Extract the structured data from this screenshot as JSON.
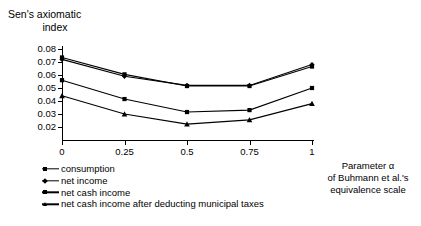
{
  "title": {
    "line1": "Sen's axiomatic",
    "line2": "index"
  },
  "axis": {
    "y_ticks": [
      "0.08",
      "0.07",
      "0.06",
      "0.05",
      "0.04",
      "0.03",
      "0.02"
    ],
    "x_ticks": [
      "0",
      "0.25",
      "0.5",
      "0.75",
      "1"
    ],
    "x_caption_line1": "Parameter α",
    "x_caption_line2": "of Buhmann et al.'s",
    "x_caption_line3": "equivalence scale"
  },
  "legend": {
    "items": [
      {
        "label": "consumption",
        "marker": "square"
      },
      {
        "label": "net income",
        "marker": "diamond"
      },
      {
        "label": "net cash income",
        "marker": "square"
      },
      {
        "label": "net cash income after deducting municipal taxes",
        "marker": "triangle"
      }
    ]
  },
  "chart_data": {
    "type": "line",
    "title": "Sen's axiomatic index",
    "xlabel": "Parameter α of Buhmann et al.'s equivalence scale",
    "ylabel": "Sen's axiomatic index",
    "x": [
      0,
      0.25,
      0.5,
      0.75,
      1
    ],
    "categories": [
      "0",
      "0.25",
      "0.5",
      "0.75",
      "1"
    ],
    "ylim": [
      0.02,
      0.08
    ],
    "xlim": [
      0,
      1
    ],
    "yticks": [
      0.02,
      0.03,
      0.04,
      0.05,
      0.06,
      0.07,
      0.08
    ],
    "grid": false,
    "legend_position": "below-left",
    "series": [
      {
        "name": "consumption",
        "marker": "square",
        "values": [
          0.0735,
          0.0605,
          0.0515,
          0.0515,
          0.0665
        ]
      },
      {
        "name": "net income",
        "marker": "diamond",
        "values": [
          0.072,
          0.059,
          0.052,
          0.052,
          0.068
        ]
      },
      {
        "name": "net cash income",
        "marker": "square",
        "values": [
          0.056,
          0.0415,
          0.0315,
          0.033,
          0.05
        ]
      },
      {
        "name": "net cash income after deducting municipal taxes",
        "marker": "triangle",
        "values": [
          0.044,
          0.03,
          0.0222,
          0.0255,
          0.038
        ]
      }
    ]
  }
}
